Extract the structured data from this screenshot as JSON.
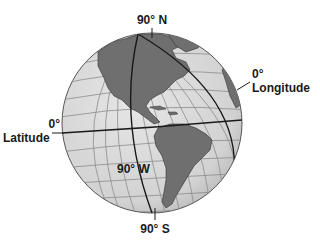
{
  "diagram": {
    "type": "globe",
    "title": "",
    "colors": {
      "ocean": "#d9d9d9",
      "land": "#6f6f6f",
      "grid": "#8c8c8c",
      "highlight_lines": "#1a1a1a",
      "text": "#1a1a1a"
    },
    "labels": {
      "north_pole": "90° N",
      "south_pole": "90° S",
      "prime_meridian_deg": "0°",
      "prime_meridian_name": "Longitude",
      "equator_deg": "0°",
      "equator_name": "Latitude",
      "meridian_90w": "90° W"
    }
  }
}
